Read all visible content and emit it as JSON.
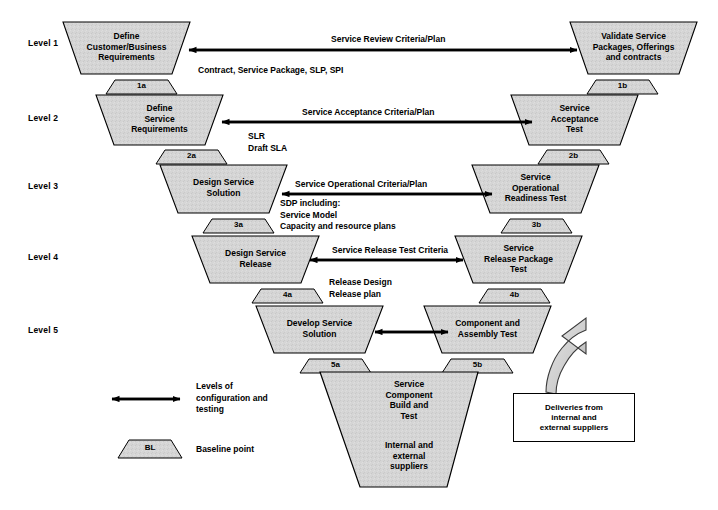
{
  "diagram": {
    "fill_color": "#d5d5d5",
    "stroke_color": "#000000",
    "background": "#ffffff"
  },
  "levels": [
    {
      "label": "Level 1"
    },
    {
      "label": "Level 2"
    },
    {
      "label": "Level 3"
    },
    {
      "label": "Level 4"
    },
    {
      "label": "Level 5"
    }
  ],
  "left_shapes": [
    {
      "id": "l1",
      "text": "Define\nCustomer/Business\nRequirements"
    },
    {
      "id": "l2",
      "text": "Define\nService\nRequirements"
    },
    {
      "id": "l3",
      "text": "Design Service\nSolution"
    },
    {
      "id": "l4",
      "text": "Design Service\nRelease"
    },
    {
      "id": "l5",
      "text": "Develop Service\nSolution"
    }
  ],
  "right_shapes": [
    {
      "id": "r1",
      "text": "Validate Service\nPackages, Offerings\nand contracts"
    },
    {
      "id": "r2",
      "text": "Service\nAcceptance\nTest"
    },
    {
      "id": "r3",
      "text": "Service\nOperational\nReadiness Test"
    },
    {
      "id": "r4",
      "text": "Service\nRelease Package\nTest"
    },
    {
      "id": "r5",
      "text": "Component and\nAssembly Test"
    }
  ],
  "baselines_left": [
    {
      "id": "1a",
      "label": "1a"
    },
    {
      "id": "2a",
      "label": "2a"
    },
    {
      "id": "3a",
      "label": "3a"
    },
    {
      "id": "4a",
      "label": "4a"
    },
    {
      "id": "5a",
      "label": "5a"
    }
  ],
  "baselines_right": [
    {
      "id": "1b",
      "label": "1b"
    },
    {
      "id": "2b",
      "label": "2b"
    },
    {
      "id": "3b",
      "label": "3b"
    },
    {
      "id": "4b",
      "label": "4b"
    },
    {
      "id": "5b",
      "label": "5b"
    }
  ],
  "arrow_labels": [
    {
      "id": "a1",
      "text": "Service Review Criteria/Plan"
    },
    {
      "id": "a2",
      "text": "Service Acceptance Criteria/Plan"
    },
    {
      "id": "a3",
      "text": "Service Operational Criteria/Plan"
    },
    {
      "id": "a4",
      "text": "Service Release Test Criteria"
    }
  ],
  "notes": [
    {
      "id": "n1",
      "text": "Contract, Service Package, SLP, SPI"
    },
    {
      "id": "n2",
      "text": "SLR\nDraft SLA"
    },
    {
      "id": "n3",
      "text": "SDP including:\nService Model\nCapacity and resource plans"
    },
    {
      "id": "n4",
      "text": "Release Design\nRelease plan"
    }
  ],
  "bottom_shape": {
    "top_text": "Service\nComponent\nBuild and\nTest",
    "bottom_text": "Internal and\nexternal\nsuppliers"
  },
  "delivery_box": {
    "text": "Deliveries from\ninternal and\nexternal suppliers"
  },
  "legend": [
    {
      "id": "legend-arrow",
      "icon": "double-arrow-icon",
      "text": "Levels of\nconfiguration and\ntesting"
    },
    {
      "id": "legend-baseline",
      "icon": "baseline-trapezoid-icon",
      "shape_label": "BL",
      "text": "Baseline point"
    }
  ]
}
